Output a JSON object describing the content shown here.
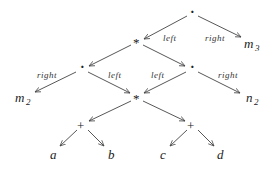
{
  "diagram": {
    "type": "expression-dag",
    "nodes": [
      {
        "id": "root",
        "label": "·",
        "x": 192,
        "y": 14
      },
      {
        "id": "mul_top",
        "label": "*",
        "x": 137,
        "y": 42
      },
      {
        "id": "m3",
        "label": "m",
        "sub": "3",
        "x": 254,
        "y": 44
      },
      {
        "id": "dot_left",
        "label": "·",
        "x": 82,
        "y": 69
      },
      {
        "id": "dot_right",
        "label": "·",
        "x": 192,
        "y": 69
      },
      {
        "id": "m2",
        "label": "m",
        "sub": "2",
        "x": 22,
        "y": 100
      },
      {
        "id": "mul_bottom",
        "label": "*",
        "x": 137,
        "y": 98
      },
      {
        "id": "n2",
        "label": "n",
        "sub": "2",
        "x": 252,
        "y": 100
      },
      {
        "id": "plus_left",
        "label": "+",
        "x": 82,
        "y": 126
      },
      {
        "id": "plus_right",
        "label": "+",
        "x": 192,
        "y": 126
      },
      {
        "id": "a",
        "label": "a",
        "x": 53,
        "y": 158
      },
      {
        "id": "b",
        "label": "b",
        "x": 111,
        "y": 158
      },
      {
        "id": "c",
        "label": "c",
        "x": 163,
        "y": 158
      },
      {
        "id": "d",
        "label": "d",
        "x": 220,
        "y": 158
      }
    ],
    "edges": [
      {
        "from": "root",
        "to": "mul_top",
        "label": "left"
      },
      {
        "from": "root",
        "to": "m3",
        "label": "right"
      },
      {
        "from": "mul_top",
        "to": "dot_left",
        "label": ""
      },
      {
        "from": "mul_top",
        "to": "dot_right",
        "label": ""
      },
      {
        "from": "dot_left",
        "to": "m2",
        "label": "right"
      },
      {
        "from": "dot_left",
        "to": "mul_bottom",
        "label": "left"
      },
      {
        "from": "dot_right",
        "to": "mul_bottom",
        "label": "left"
      },
      {
        "from": "dot_right",
        "to": "n2",
        "label": "right"
      },
      {
        "from": "mul_bottom",
        "to": "plus_left",
        "label": ""
      },
      {
        "from": "mul_bottom",
        "to": "plus_right",
        "label": ""
      },
      {
        "from": "plus_left",
        "to": "a",
        "label": ""
      },
      {
        "from": "plus_left",
        "to": "b",
        "label": ""
      },
      {
        "from": "plus_right",
        "to": "c",
        "label": ""
      },
      {
        "from": "plus_right",
        "to": "d",
        "label": ""
      }
    ],
    "labels": {
      "root_left": "left",
      "root_right": "right",
      "dotl_right": "right",
      "dotl_left": "left",
      "dotr_left": "left",
      "dotr_right": "right"
    },
    "text": {
      "root": "·",
      "mul_top": "*",
      "dot_left": "·",
      "dot_right": "·",
      "mul_bottom": "*",
      "plus_left": "+",
      "plus_right": "+",
      "m": "m",
      "n": "n",
      "sub3": "3",
      "sub2": "2",
      "a": "a",
      "b": "b",
      "c": "c",
      "d": "d"
    }
  }
}
